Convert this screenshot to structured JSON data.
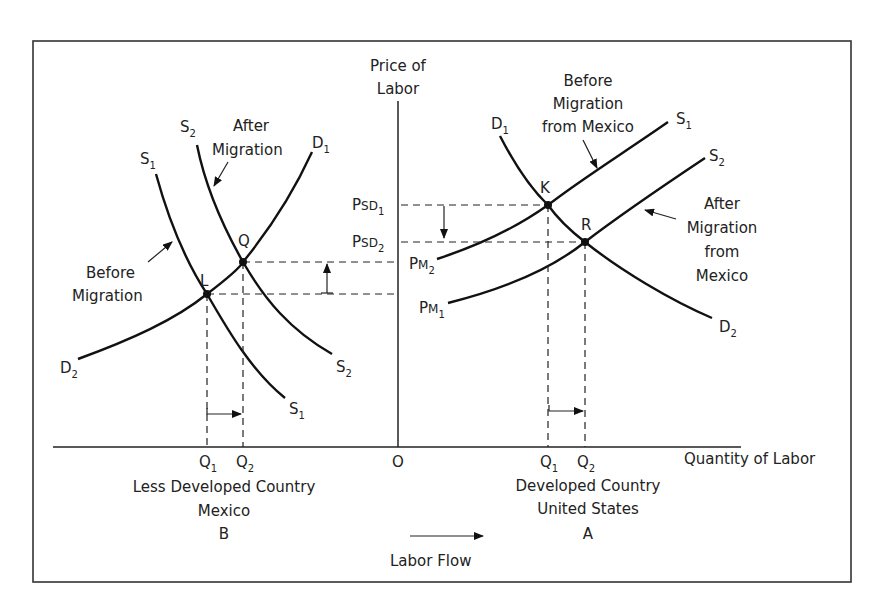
{
  "axes": {
    "y_label_line1": "Price of",
    "y_label_line2": "Labor",
    "x_label": "Quantity of Labor",
    "origin": "O"
  },
  "left_panel": {
    "country_line1": "Less Developed Country",
    "country_line2": "Mexico",
    "country_letter": "B",
    "curves": {
      "s1_top": "S",
      "s1_top_sub": "1",
      "s2_top": "S",
      "s2_top_sub": "2",
      "d1": "D",
      "d1_sub": "1",
      "d2": "D",
      "d2_sub": "2",
      "s1_bottom": "S",
      "s1_bottom_sub": "1",
      "s2_bottom": "S",
      "s2_bottom_sub": "2"
    },
    "annotations": {
      "after_line1": "After",
      "after_line2": "Migration",
      "before_line1": "Before",
      "before_line2": "Migration"
    },
    "points": {
      "l": "L",
      "q": "Q"
    },
    "ticks": {
      "q1": "Q",
      "q1_sub": "1",
      "q2": "Q",
      "q2_sub": "2"
    }
  },
  "right_panel": {
    "country_line1": "Developed Country",
    "country_line2": "United States",
    "country_letter": "A",
    "curves": {
      "d1": "D",
      "d1_sub": "1",
      "d2": "D",
      "d2_sub": "2",
      "s1": "S",
      "s1_sub": "1",
      "s2": "S",
      "s2_sub": "2",
      "pm1": "P",
      "pm1_mid": "M",
      "pm1_sub": "1",
      "pm2": "P",
      "pm2_mid": "M",
      "pm2_sub": "2"
    },
    "price_labels": {
      "psd1": "P",
      "psd1_mid": "SD",
      "psd1_sub": "1",
      "psd2": "P",
      "psd2_mid": "SD",
      "psd2_sub": "2"
    },
    "annotations": {
      "before_line1": "Before",
      "before_line2": "Migration",
      "before_line3": "from Mexico",
      "after_line1": "After",
      "after_line2": "Migration",
      "after_line3": "from",
      "after_line4": "Mexico"
    },
    "points": {
      "k": "K",
      "r": "R"
    },
    "ticks": {
      "q1": "Q",
      "q1_sub": "1",
      "q2": "Q",
      "q2_sub": "2"
    }
  },
  "legend": {
    "labor_flow": "Labor Flow"
  }
}
